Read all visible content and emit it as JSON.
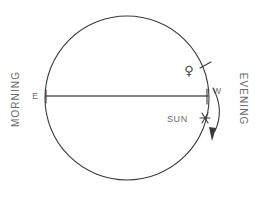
{
  "diagram": {
    "background_color": "#ffffff",
    "line_color": "#3a3a3a",
    "text_color": "#6b6b6b",
    "circle": {
      "center_x": 127,
      "center_y": 98,
      "radius": 82
    },
    "horizon": {
      "y": 96,
      "x_start": 45,
      "x_end": 209
    },
    "labels": {
      "east": "E",
      "west": "W",
      "morning": "MORNING",
      "evening": "EVENING",
      "sun": "SUN"
    },
    "markers": [
      {
        "name": "venus",
        "symbol": "♀",
        "label": "",
        "x": 189,
        "y": 70,
        "tick_x": 206,
        "tick_y": 66
      },
      {
        "name": "sun",
        "symbol": "✳",
        "label": "SUN",
        "x": 206,
        "y": 118,
        "label_x": 166,
        "label_y": 122
      }
    ],
    "motion_arrow": {
      "name": "clockwise-motion-arrow",
      "direction": "clockwise",
      "description": "curved arrow outside circle pointing downward"
    }
  }
}
